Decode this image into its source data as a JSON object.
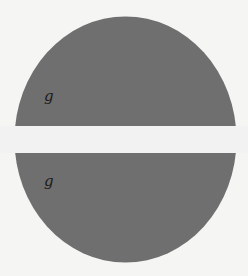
{
  "diagram": {
    "shape": "circle-split-by-horizontal-band",
    "fill_color": "#6f6f6f",
    "band_color": "#f2f2f2",
    "background_color": "#f5f5f4",
    "labels": [
      {
        "text": "g",
        "region": "upper"
      },
      {
        "text": "g",
        "region": "lower"
      }
    ]
  }
}
